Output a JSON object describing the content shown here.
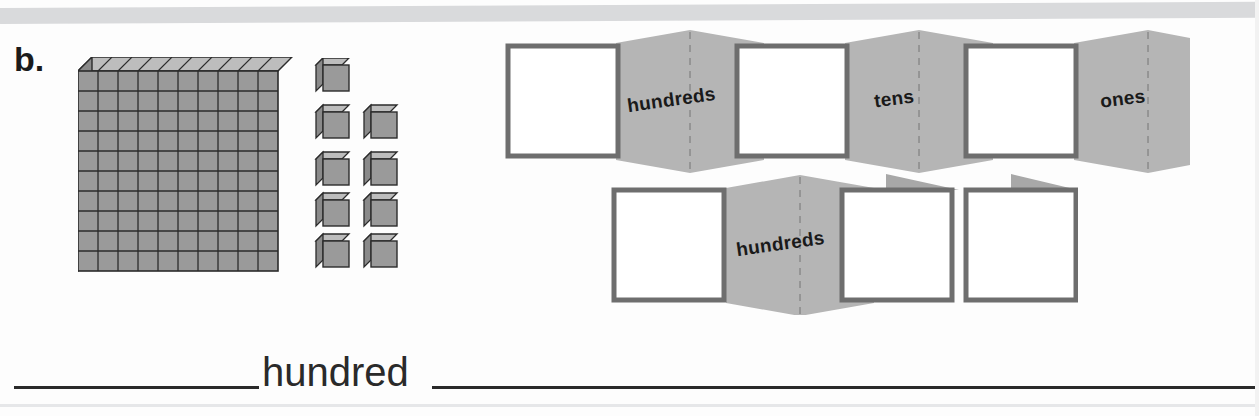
{
  "worksheet": {
    "problem_letter": "b.",
    "answer_word": "hundred",
    "colors": {
      "block_fill": "#9a9a9a",
      "block_top_fill": "#bdbdbd",
      "block_side_fill": "#8a8a8a",
      "block_stroke": "#2b2b2b",
      "panel_gray": "#b5b5b5",
      "square_border": "#6e6e6e",
      "square_fill": "#ffffff",
      "flap_gray": "#a8a8a8",
      "fold_dash": "#8d8d8d",
      "ink": "#1a1a1a",
      "top_band": "#d9dadc"
    }
  },
  "base_ten_blocks": {
    "flat": {
      "name": "hundreds-flat",
      "rows": 10,
      "columns": 10,
      "value": 100
    },
    "units": {
      "name": "unit-cubes",
      "count": 9,
      "value": 9,
      "layout_rows": [
        1,
        2,
        2,
        2,
        2
      ]
    },
    "total_value": 109
  },
  "place_value_strips": [
    {
      "name": "top-strip",
      "cells": [
        {
          "type": "window",
          "label": ""
        },
        {
          "type": "panel",
          "label": "hundreds"
        },
        {
          "type": "window",
          "label": ""
        },
        {
          "type": "panel",
          "label": "tens"
        },
        {
          "type": "window",
          "label": ""
        },
        {
          "type": "panel",
          "label": "ones"
        }
      ]
    },
    {
      "name": "bottom-strip",
      "cells": [
        {
          "type": "window",
          "label": ""
        },
        {
          "type": "panel",
          "label": "hundreds"
        },
        {
          "type": "window",
          "label": ""
        },
        {
          "type": "window",
          "label": ""
        }
      ],
      "folded_flaps": 2
    }
  ],
  "labels": {
    "hundreds": "hundreds",
    "tens": "tens",
    "ones": "ones"
  }
}
